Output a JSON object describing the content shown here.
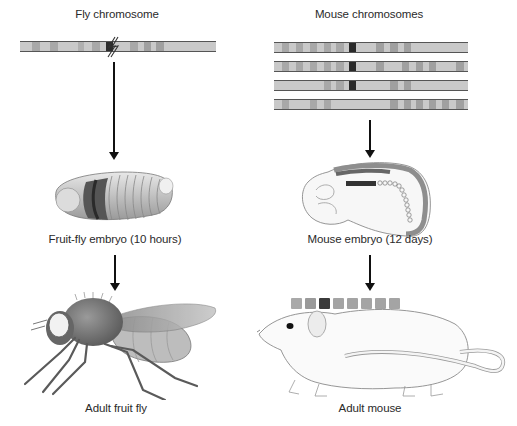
{
  "left_column": {
    "title": "Fly chromosome",
    "embryo_label": "Fruit-fly embryo (10 hours)",
    "adult_label": "Adult fruit fly",
    "chromosome_bands": [
      {
        "x": 12,
        "w": 8,
        "c": "#a8a8a8"
      },
      {
        "x": 30,
        "w": 8,
        "c": "#a8a8a8"
      },
      {
        "x": 58,
        "w": 6,
        "c": "#b0b0b0"
      },
      {
        "x": 72,
        "w": 8,
        "c": "#a8a8a8"
      },
      {
        "x": 86,
        "w": 7,
        "c": "#2c2c2c"
      },
      {
        "x": 110,
        "w": 8,
        "c": "#a8a8a8"
      },
      {
        "x": 124,
        "w": 7,
        "c": "#a0a0a0"
      },
      {
        "x": 136,
        "w": 8,
        "c": "#a0a0a0"
      }
    ],
    "break_symbol": "double-slash"
  },
  "right_column": {
    "title": "Mouse chromosomes",
    "embryo_label": "Mouse embryo (12 days)",
    "adult_label": "Adult mouse",
    "chromosomes": [
      [
        {
          "x": 8,
          "w": 7,
          "c": "#a8a8a8"
        },
        {
          "x": 22,
          "w": 7,
          "c": "#a8a8a8"
        },
        {
          "x": 36,
          "w": 7,
          "c": "#a8a8a8"
        },
        {
          "x": 50,
          "w": 7,
          "c": "#a8a8a8"
        },
        {
          "x": 62,
          "w": 8,
          "c": "#a8a8a8"
        },
        {
          "x": 75,
          "w": 7,
          "c": "#2a2a2a"
        },
        {
          "x": 102,
          "w": 8,
          "c": "#a0a0a0"
        },
        {
          "x": 116,
          "w": 8,
          "c": "#a0a0a0"
        },
        {
          "x": 130,
          "w": 7,
          "c": "#a0a0a0"
        }
      ],
      [
        {
          "x": 8,
          "w": 7,
          "c": "#a8a8a8"
        },
        {
          "x": 22,
          "w": 7,
          "c": "#a8a8a8"
        },
        {
          "x": 36,
          "w": 7,
          "c": "#a8a8a8"
        },
        {
          "x": 50,
          "w": 7,
          "c": "#a8a8a8"
        },
        {
          "x": 62,
          "w": 8,
          "c": "#a8a8a8"
        },
        {
          "x": 75,
          "w": 7,
          "c": "#2a2a2a"
        },
        {
          "x": 102,
          "w": 8,
          "c": "#a0a0a0"
        },
        {
          "x": 128,
          "w": 7,
          "c": "#a0a0a0"
        },
        {
          "x": 142,
          "w": 7,
          "c": "#a0a0a0"
        },
        {
          "x": 155,
          "w": 7,
          "c": "#a0a0a0"
        },
        {
          "x": 182,
          "w": 8,
          "c": "#a0a0a0"
        }
      ],
      [
        {
          "x": 50,
          "w": 7,
          "c": "#a8a8a8"
        },
        {
          "x": 62,
          "w": 8,
          "c": "#a8a8a8"
        },
        {
          "x": 75,
          "w": 7,
          "c": "#2a2a2a"
        },
        {
          "x": 116,
          "w": 8,
          "c": "#a0a0a0"
        },
        {
          "x": 130,
          "w": 7,
          "c": "#a0a0a0"
        }
      ],
      [
        {
          "x": 8,
          "w": 7,
          "c": "#a8a8a8"
        },
        {
          "x": 36,
          "w": 7,
          "c": "#a8a8a8"
        },
        {
          "x": 50,
          "w": 7,
          "c": "#a8a8a8"
        },
        {
          "x": 116,
          "w": 8,
          "c": "#a0a0a0"
        },
        {
          "x": 130,
          "w": 7,
          "c": "#a0a0a0"
        },
        {
          "x": 142,
          "w": 7,
          "c": "#a0a0a0"
        },
        {
          "x": 155,
          "w": 7,
          "c": "#a0a0a0"
        },
        {
          "x": 168,
          "w": 7,
          "c": "#a0a0a0"
        },
        {
          "x": 182,
          "w": 8,
          "c": "#a0a0a0"
        }
      ]
    ],
    "body_segments": [
      {
        "c": "#a9a9a9"
      },
      {
        "c": "#9a9a9a"
      },
      {
        "c": "#3a3a3a"
      },
      {
        "c": "#a4a4a4"
      },
      {
        "c": "#a4a4a4"
      },
      {
        "c": "#a4a4a4"
      },
      {
        "c": "#a4a4a4"
      },
      {
        "c": "#a4a4a4"
      }
    ]
  },
  "colors": {
    "chromosome_base": "#c9c9c9",
    "chromosome_border": "#555555",
    "dark_band": "#2a2a2a",
    "arrow": "#111111"
  }
}
